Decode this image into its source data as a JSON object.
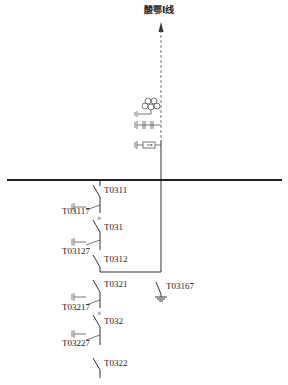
{
  "diagram": {
    "type": "single-line electrical substation diagram",
    "line_name": "酸鄂Ⅰ线",
    "line_equipment": [
      "surge-arrester",
      "capacitor-voltage-transformer",
      "line-trap"
    ],
    "labels": {
      "t0311": "T0311",
      "t03117": "T03117",
      "t031": "T031",
      "t03127": "T03127",
      "t0312": "T0312",
      "t0321": "T0321",
      "t03167": "T03167",
      "t03217": "T03217",
      "t032": "T032",
      "t03227": "T03227",
      "t0322": "T0322"
    }
  }
}
